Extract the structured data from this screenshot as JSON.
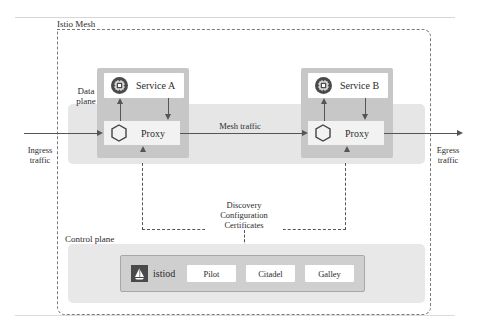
{
  "mesh": {
    "label": "Istio Mesh"
  },
  "data_plane": {
    "label_line1": "Data",
    "label_line2": "plane",
    "services": [
      {
        "name": "Service A",
        "icon": "chip-icon",
        "proxy_label": "Proxy",
        "proxy_icon": "hexagon-icon"
      },
      {
        "name": "Service B",
        "icon": "chip-icon",
        "proxy_label": "Proxy",
        "proxy_icon": "hexagon-icon"
      }
    ],
    "mesh_traffic_label": "Mesh traffic"
  },
  "traffic": {
    "ingress_line1": "Ingress",
    "ingress_line2": "traffic",
    "egress_line1": "Egress",
    "egress_line2": "traffic"
  },
  "control_link": {
    "lines": [
      "Discovery",
      "Configuration",
      "Certificates"
    ]
  },
  "control_plane": {
    "label": "Control plane",
    "istiod": {
      "name": "istiod",
      "icon": "istio-sail-icon",
      "components": [
        "Pilot",
        "Citadel",
        "Galley"
      ]
    }
  },
  "colors": {
    "pod_bg": "#c7c7c7",
    "region_bg": "#e6e6e6",
    "icon_dark": "#4a4a4a",
    "line": "#555555"
  }
}
